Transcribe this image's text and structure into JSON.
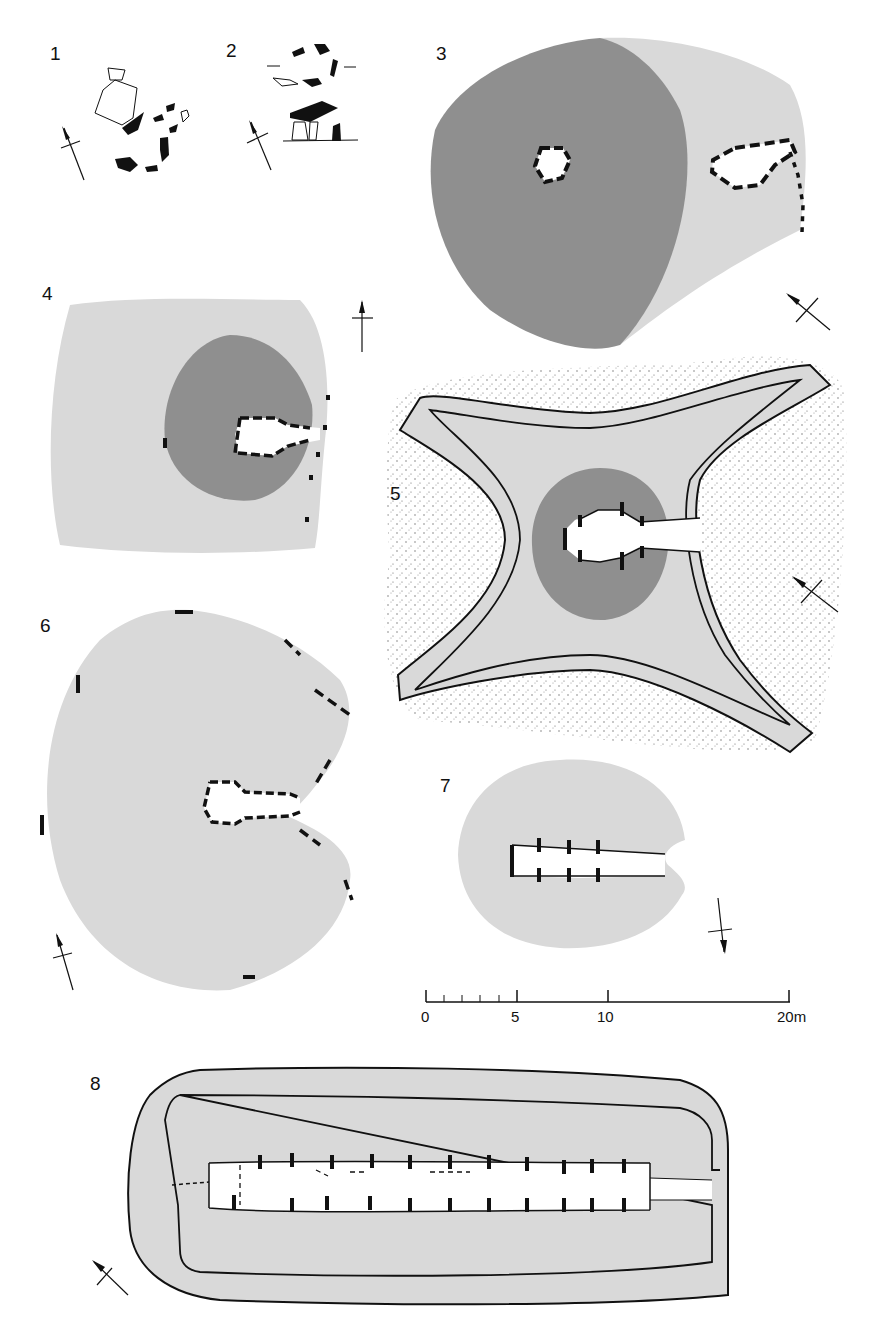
{
  "figure": {
    "type": "archaeological plan plate",
    "plans": [
      {
        "id": "1",
        "label": "1"
      },
      {
        "id": "2",
        "label": "2"
      },
      {
        "id": "3",
        "label": "3"
      },
      {
        "id": "4",
        "label": "4"
      },
      {
        "id": "5",
        "label": "5"
      },
      {
        "id": "6",
        "label": "6"
      },
      {
        "id": "7",
        "label": "7"
      },
      {
        "id": "8",
        "label": "8"
      }
    ],
    "scale_bar": {
      "ticks": [
        "0",
        "5",
        "10",
        "20m"
      ],
      "minor_ticks": 5
    },
    "colors": {
      "mound_light": "#d9d9d9",
      "cairn_dark": "#8f8f8f",
      "stone": "#111111",
      "stipple": "#555555",
      "background": "#ffffff"
    }
  }
}
